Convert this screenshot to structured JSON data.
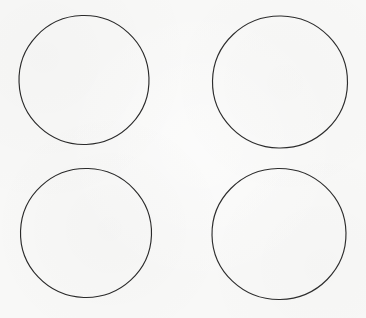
{
  "canvas": {
    "width": 366,
    "height": 318,
    "background_color": "#f8f8f7",
    "description": "Four plain unfilled circles arranged in a two-by-two grid on an off-white background"
  },
  "style": {
    "stroke_color": "#2a2a2a",
    "stroke_width": 1.15,
    "fill": "none"
  },
  "shapes": [
    {
      "name": "circle-top-left",
      "type": "circle",
      "cx": 84,
      "cy": 80,
      "rx": 65,
      "ry": 64.5,
      "rotation": -2,
      "stroke_color": "#2a2a2a",
      "stroke_width": 1.15
    },
    {
      "name": "circle-top-right",
      "type": "circle",
      "cx": 280,
      "cy": 82,
      "rx": 67.5,
      "ry": 66,
      "rotation": 1,
      "stroke_color": "#2d2d2d",
      "stroke_width": 1.15
    },
    {
      "name": "circle-bottom-left",
      "type": "circle",
      "cx": 86,
      "cy": 233,
      "rx": 65.5,
      "ry": 64.5,
      "rotation": 2,
      "stroke_color": "#2a2a2a",
      "stroke_width": 1.15
    },
    {
      "name": "circle-bottom-right",
      "type": "circle",
      "cx": 279,
      "cy": 234,
      "rx": 67,
      "ry": 65.5,
      "rotation": -1,
      "stroke_color": "#2d2d2d",
      "stroke_width": 1.15
    }
  ]
}
